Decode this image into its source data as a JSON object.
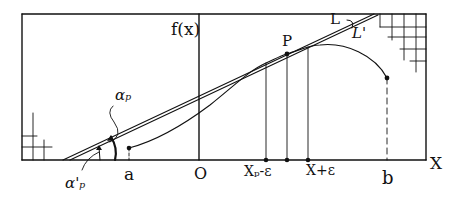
{
  "diagram": {
    "type": "function-graph-with-tangent-lines",
    "axes": {
      "y_label": "f(x)",
      "x_label": "X",
      "origin_label": "O"
    },
    "points": {
      "tangent_point": "P",
      "interval_start": "a",
      "interval_end": "b",
      "left_neighbor": "X_p-ε",
      "right_neighbor": "X+ε"
    },
    "lines": {
      "line_L": "L",
      "line_L_prime": "L'"
    },
    "angles": {
      "alpha_p": "α_p",
      "alpha_p_prime": "α'_p"
    },
    "labels": {
      "fx": "f(x)",
      "P": "P",
      "L": "L",
      "L_prime": "L'",
      "alpha_p": "αₚ",
      "alpha_p_prime": "α'ₚ",
      "a": "a",
      "O": "O",
      "x_minus": "Xₚ-ε",
      "x_plus": "X+ε",
      "b": "b",
      "X": "X"
    },
    "colors": {
      "ink": "#111111",
      "paper": "#ffffff"
    }
  }
}
